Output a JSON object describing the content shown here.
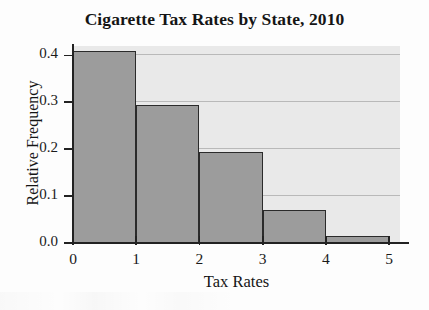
{
  "chart_data": {
    "type": "bar",
    "title": "Cigarette Tax Rates by State, 2010",
    "subtitle": "",
    "xlabel": "Tax Rates",
    "ylabel": "Relative Frequency",
    "categories": [
      "0-1",
      "1-2",
      "2-3",
      "3-4",
      "4-5"
    ],
    "bin_edges": [
      0,
      1,
      2,
      3,
      4,
      5
    ],
    "values": [
      0.41,
      0.295,
      0.195,
      0.07,
      0.015
    ],
    "xlim": [
      0,
      5.17
    ],
    "ylim": [
      0,
      0.42
    ],
    "x_ticks": [
      0,
      1,
      2,
      3,
      4,
      5
    ],
    "x_tick_labels": [
      "0",
      "1",
      "2",
      "3",
      "4",
      "5"
    ],
    "y_ticks": [
      0.0,
      0.1,
      0.2,
      0.3,
      0.4
    ],
    "y_tick_labels": [
      "0.0",
      "0.1",
      "0.2",
      "0.3",
      "0.4"
    ],
    "grid": true,
    "grid_axis": "y",
    "legend": false,
    "legend_position": "none",
    "bar_fill_color": "#9c9c9c",
    "bar_edge_color": "#2b2b2b",
    "plot_background_color": "#e9e9e9",
    "gridline_color": "#b9b9b9",
    "axis_color": "#222222",
    "figure_background_color": "#fdfdfd"
  }
}
